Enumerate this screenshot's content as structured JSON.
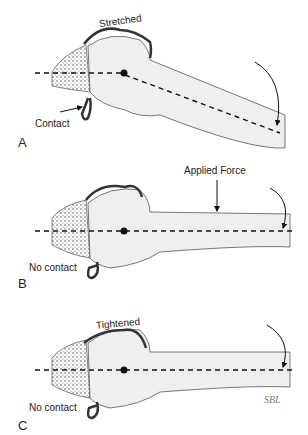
{
  "panels": [
    {
      "id": "A",
      "letter": "A",
      "labels": {
        "top": "Stretched",
        "bottom": "Contact"
      }
    },
    {
      "id": "B",
      "letter": "B",
      "labels": {
        "force": "Applied Force",
        "bottom": "No contact"
      }
    },
    {
      "id": "C",
      "letter": "C",
      "labels": {
        "top": "Tightened",
        "bottom": "No contact"
      }
    }
  ],
  "signature": "SBL",
  "colors": {
    "bone_fill": "#efefef",
    "outline": "#555555",
    "capsule": "#3a3a3a",
    "axis": "#111111"
  }
}
